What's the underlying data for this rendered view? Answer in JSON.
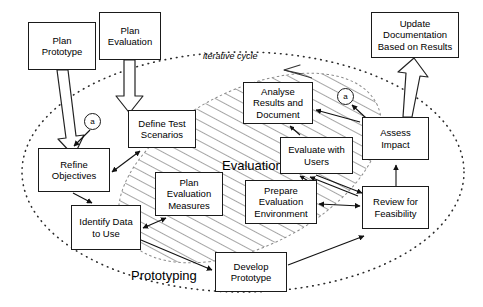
{
  "diagram": {
    "cycle_label": "iterative cycle",
    "zones": [
      {
        "id": "evaluation",
        "label": "Evaluation",
        "style": "hatched-ellipse"
      },
      {
        "id": "prototyping",
        "label": "Prototyping",
        "style": "dotted-ellipse"
      }
    ],
    "connectors": [
      {
        "id": "connector-a-left",
        "label": "a"
      },
      {
        "id": "connector-a-right",
        "label": "a"
      }
    ],
    "nodes": [
      {
        "id": "plan-prototype",
        "label": "Plan\nPrototype",
        "x": 28,
        "y": 22,
        "w": 68,
        "h": 48
      },
      {
        "id": "plan-evaluation",
        "label": "Plan\nEvaluation",
        "x": 99,
        "y": 12,
        "w": 62,
        "h": 48
      },
      {
        "id": "update-documentation",
        "label": "Update\nDocumentation\nBased on Results",
        "x": 371,
        "y": 12,
        "w": 88,
        "h": 46
      },
      {
        "id": "define-test-scenarios",
        "label": "Define Test\nScenarios",
        "x": 128,
        "y": 110,
        "w": 68,
        "h": 38
      },
      {
        "id": "analyse-results",
        "label": "Analyse\nResults and\nDocument",
        "x": 243,
        "y": 82,
        "w": 70,
        "h": 42
      },
      {
        "id": "assess-impact",
        "label": "Assess\nImpact",
        "x": 362,
        "y": 117,
        "w": 67,
        "h": 43
      },
      {
        "id": "evaluate-with-users",
        "label": "Evaluate with\nUsers",
        "x": 280,
        "y": 137,
        "w": 73,
        "h": 37
      },
      {
        "id": "refine-objectives",
        "label": "Refine\nObjectives",
        "x": 38,
        "y": 148,
        "w": 72,
        "h": 44
      },
      {
        "id": "plan-evaluation-measures",
        "label": "Plan\nEvaluation\nMeasures",
        "x": 155,
        "y": 172,
        "w": 68,
        "h": 44
      },
      {
        "id": "prepare-evaluation-environment",
        "label": "Prepare\nEvaluation\nEnvironment",
        "x": 245,
        "y": 180,
        "w": 72,
        "h": 44
      },
      {
        "id": "review-for-feasibility",
        "label": "Review for\nFeasibility",
        "x": 362,
        "y": 186,
        "w": 67,
        "h": 43
      },
      {
        "id": "identify-data",
        "label": "Identify Data\nto Use",
        "x": 71,
        "y": 205,
        "w": 70,
        "h": 45
      },
      {
        "id": "develop-prototype",
        "label": "Develop\nPrototype",
        "x": 215,
        "y": 252,
        "w": 72,
        "h": 40
      }
    ],
    "colors": {
      "stroke": "#1a1a1a",
      "fill": "#ffffff",
      "hatch": "#555555",
      "dotted": "#333333"
    }
  }
}
